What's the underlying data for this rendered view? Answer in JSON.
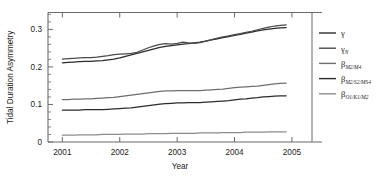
{
  "chart_data": {
    "type": "line",
    "title": "",
    "xlabel": "Year",
    "ylabel": "Tidal Duration Asymmetry",
    "xlim": [
      2000.75,
      2005.35
    ],
    "ylim": [
      0,
      0.345
    ],
    "xticks": [
      2001,
      2002,
      2003,
      2004,
      2005
    ],
    "xtick_labels": [
      "2001",
      "2002",
      "2003",
      "2004",
      "2005"
    ],
    "yticks": [
      0,
      0.1,
      0.2,
      0.3
    ],
    "ytick_labels": [
      "0",
      "0.1",
      "0.2",
      "0.3"
    ],
    "grid": false,
    "legend_position": "right-outside",
    "x": [
      2001.0,
      2001.1,
      2001.2,
      2001.3,
      2001.4,
      2001.5,
      2001.6,
      2001.7,
      2001.8,
      2001.9,
      2002.0,
      2002.1,
      2002.2,
      2002.3,
      2002.4,
      2002.5,
      2002.6,
      2002.7,
      2002.8,
      2002.9,
      2003.0,
      2003.1,
      2003.2,
      2003.3,
      2003.4,
      2003.5,
      2003.6,
      2003.7,
      2003.8,
      2003.9,
      2004.0,
      2004.1,
      2004.2,
      2004.3,
      2004.4,
      2004.5,
      2004.6,
      2004.7,
      2004.8,
      2004.9
    ],
    "series": [
      {
        "name": "gamma",
        "label": "γ",
        "color": "#2b2b2b",
        "values": [
          0.211,
          0.212,
          0.213,
          0.214,
          0.215,
          0.215,
          0.216,
          0.217,
          0.219,
          0.221,
          0.224,
          0.228,
          0.232,
          0.236,
          0.24,
          0.244,
          0.248,
          0.252,
          0.255,
          0.257,
          0.259,
          0.261,
          0.262,
          0.264,
          0.266,
          0.269,
          0.272,
          0.275,
          0.278,
          0.281,
          0.284,
          0.287,
          0.29,
          0.293,
          0.296,
          0.299,
          0.301,
          0.303,
          0.304,
          0.305
        ]
      },
      {
        "name": "gamma_N",
        "label": "γ",
        "sub": "N",
        "color": "#4a4a4a",
        "values": [
          0.221,
          0.222,
          0.223,
          0.224,
          0.225,
          0.225,
          0.226,
          0.228,
          0.23,
          0.233,
          0.234,
          0.235,
          0.236,
          0.239,
          0.245,
          0.251,
          0.256,
          0.26,
          0.262,
          0.261,
          0.263,
          0.266,
          0.264,
          0.263,
          0.265,
          0.269,
          0.273,
          0.277,
          0.28,
          0.283,
          0.286,
          0.289,
          0.292,
          0.295,
          0.299,
          0.303,
          0.306,
          0.309,
          0.311,
          0.312
        ]
      },
      {
        "name": "beta_M2_M4",
        "label": "β",
        "sub": "M2/M4",
        "color": "#6e6e6e",
        "values": [
          0.113,
          0.113,
          0.114,
          0.114,
          0.115,
          0.115,
          0.116,
          0.117,
          0.118,
          0.119,
          0.121,
          0.123,
          0.125,
          0.127,
          0.129,
          0.131,
          0.133,
          0.135,
          0.136,
          0.136,
          0.137,
          0.137,
          0.137,
          0.137,
          0.137,
          0.138,
          0.139,
          0.14,
          0.141,
          0.143,
          0.145,
          0.146,
          0.147,
          0.148,
          0.149,
          0.151,
          0.153,
          0.155,
          0.156,
          0.157
        ]
      },
      {
        "name": "beta_M2_S2_MS4",
        "label": "β",
        "sub": "M2/S2/MS4",
        "color": "#2b2b2b",
        "values": [
          0.085,
          0.085,
          0.085,
          0.085,
          0.086,
          0.086,
          0.086,
          0.086,
          0.087,
          0.088,
          0.089,
          0.09,
          0.091,
          0.093,
          0.095,
          0.097,
          0.099,
          0.101,
          0.102,
          0.103,
          0.104,
          0.104,
          0.105,
          0.105,
          0.105,
          0.106,
          0.107,
          0.108,
          0.109,
          0.11,
          0.112,
          0.114,
          0.115,
          0.117,
          0.118,
          0.12,
          0.121,
          0.122,
          0.123,
          0.123
        ]
      },
      {
        "name": "beta_O1_K1_M2",
        "label": "β",
        "sub": "O1/K1/M2",
        "color": "#8c8c8c",
        "values": [
          0.018,
          0.018,
          0.018,
          0.019,
          0.019,
          0.019,
          0.019,
          0.02,
          0.02,
          0.02,
          0.02,
          0.021,
          0.021,
          0.021,
          0.021,
          0.022,
          0.022,
          0.022,
          0.022,
          0.023,
          0.023,
          0.023,
          0.023,
          0.023,
          0.024,
          0.024,
          0.024,
          0.024,
          0.025,
          0.025,
          0.025,
          0.025,
          0.026,
          0.026,
          0.026,
          0.026,
          0.027,
          0.027,
          0.027,
          0.027
        ]
      }
    ],
    "legend_entries": [
      {
        "label": "γ",
        "sub": "",
        "color": "#2b2b2b"
      },
      {
        "label": "γ",
        "sub": "N",
        "color": "#4a4a4a"
      },
      {
        "label": "β",
        "sub": "M2/M4",
        "color": "#6e6e6e"
      },
      {
        "label": "β",
        "sub": "M2/S2/MS4",
        "color": "#2b2b2b"
      },
      {
        "label": "β",
        "sub": "O1/K1/M2",
        "color": "#8c8c8c"
      }
    ]
  },
  "axis": {
    "frame_color": "#6b6b6b"
  }
}
